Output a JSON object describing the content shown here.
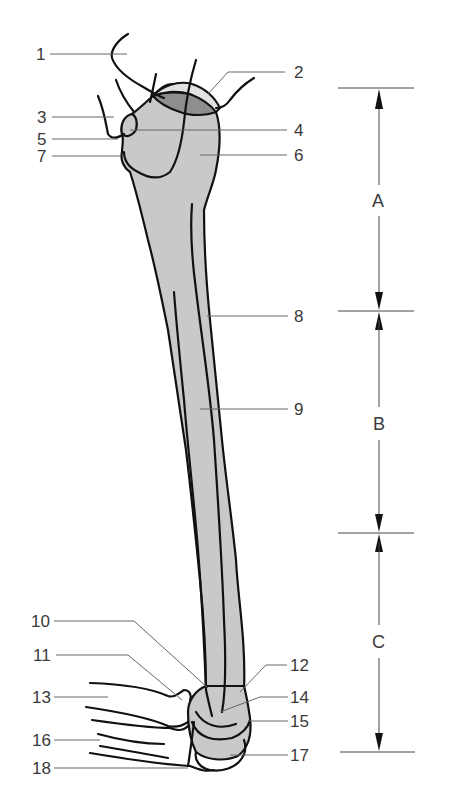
{
  "figure": {
    "colors": {
      "bone_fill": "#c9c9c9",
      "articular_surface": "#8e8e8e",
      "cartilage_rim": "#e2e2e2",
      "outline": "#111111",
      "label_text": "#3a3a3a"
    },
    "labels": [
      {
        "id": "1",
        "text": "1",
        "side": "left"
      },
      {
        "id": "2",
        "text": "2",
        "side": "right"
      },
      {
        "id": "3",
        "text": "3",
        "side": "left"
      },
      {
        "id": "4",
        "text": "4",
        "side": "right"
      },
      {
        "id": "5",
        "text": "5",
        "side": "left"
      },
      {
        "id": "6",
        "text": "6",
        "side": "right"
      },
      {
        "id": "7",
        "text": "7",
        "side": "left"
      },
      {
        "id": "8",
        "text": "8",
        "side": "right"
      },
      {
        "id": "9",
        "text": "9",
        "side": "right"
      },
      {
        "id": "10",
        "text": "10",
        "side": "left"
      },
      {
        "id": "11",
        "text": "11",
        "side": "left"
      },
      {
        "id": "12",
        "text": "12",
        "side": "right"
      },
      {
        "id": "13",
        "text": "13",
        "side": "left"
      },
      {
        "id": "14",
        "text": "14",
        "side": "right"
      },
      {
        "id": "15",
        "text": "15",
        "side": "right"
      },
      {
        "id": "16",
        "text": "16",
        "side": "left"
      },
      {
        "id": "17",
        "text": "17",
        "side": "right"
      },
      {
        "id": "18",
        "text": "18",
        "side": "left"
      }
    ],
    "dimensions": [
      {
        "id": "A",
        "text": "A"
      },
      {
        "id": "B",
        "text": "B"
      },
      {
        "id": "C",
        "text": "C"
      }
    ]
  }
}
